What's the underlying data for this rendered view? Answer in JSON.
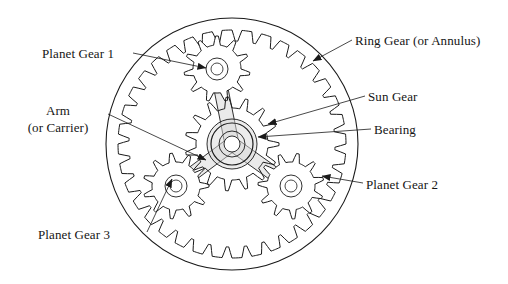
{
  "figure": {
    "type": "engineering-line-drawing",
    "background_color": "#ffffff",
    "line_color": "#1a1a1a",
    "shading_color": "#d9d9d9"
  },
  "labels": {
    "planet_gear_1": "Planet Gear 1",
    "ring_gear": "Ring Gear (or Annulus)",
    "arm_line1": "Arm",
    "arm_line2": "(or Carrier)",
    "sun_gear": "Sun Gear",
    "bearing": "Bearing",
    "planet_gear_2": "Planet Gear 2",
    "planet_gear_3": "Planet Gear 3"
  },
  "geometry": {
    "ring_gear": {
      "center_x": 232,
      "center_y": 144,
      "outer_radius": 126,
      "tooth_tip_radius": 103,
      "tooth_root_radius": 114,
      "teeth": 36
    },
    "sun_gear": {
      "center_x": 232,
      "center_y": 144,
      "tooth_tip_radius": 47,
      "tooth_root_radius": 36,
      "teeth": 15,
      "hub_outer_radius": 21,
      "hub_inner_radius": 13,
      "bore_radius": 8
    },
    "planet_radius_tip": 33,
    "planet_radius_root": 24,
    "planet_teeth": 11,
    "planet_hub_radius": 11,
    "planet_bore_radius": 6,
    "planets": [
      {
        "name": "planet-gear-1",
        "center_x": 217,
        "center_y": 69
      },
      {
        "name": "planet-gear-2",
        "center_x": 291,
        "center_y": 186
      },
      {
        "name": "planet-gear-3",
        "center_x": 176,
        "center_y": 186
      }
    ],
    "carrier_arm_half_width": 7,
    "carrier_hub_radius": 25
  },
  "leader_lines": [
    {
      "name": "leader-planet-1",
      "x1": 133,
      "y1": 53,
      "x2": 206,
      "y2": 68,
      "arrow": true
    },
    {
      "name": "leader-ring",
      "x1": 352,
      "y1": 40,
      "x2": 313,
      "y2": 61,
      "arrow": true
    },
    {
      "name": "leader-arm",
      "x1": 108,
      "y1": 114,
      "x2": 206,
      "y2": 160,
      "arrow": true
    },
    {
      "name": "leader-sun",
      "x1": 365,
      "y1": 96,
      "x2": 268,
      "y2": 124,
      "arrow": true
    },
    {
      "name": "leader-bearing",
      "x1": 371,
      "y1": 129,
      "x2": 258,
      "y2": 137,
      "arrow": true
    },
    {
      "name": "leader-planet-2",
      "x1": 363,
      "y1": 183,
      "x2": 322,
      "y2": 176,
      "arrow": true
    },
    {
      "name": "leader-planet-3",
      "x1": 147,
      "y1": 232,
      "x2": 172,
      "y2": 179,
      "arrow": true
    }
  ]
}
